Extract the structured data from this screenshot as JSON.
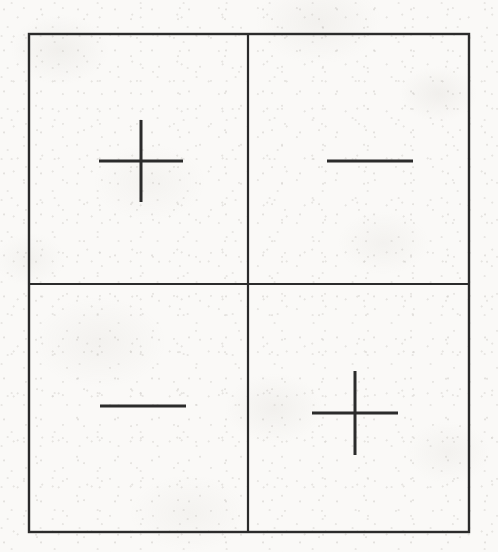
{
  "figure": {
    "canvas": {
      "width": 498,
      "height": 552
    },
    "background_color": "#faf9f7",
    "ink_color": "#2b2b2b",
    "frame": {
      "label": "outer-rectangle",
      "x": 29,
      "y": 34,
      "width": 440,
      "height": 498,
      "stroke_width": 2.4
    },
    "dividers": [
      {
        "label": "vertical-divider",
        "orientation": "vertical",
        "position": 248,
        "from": 34,
        "to": 532,
        "stroke_width": 2.2
      },
      {
        "label": "horizontal-divider",
        "orientation": "horizontal",
        "position": 284,
        "from": 29,
        "to": 469,
        "stroke_width": 2.2
      }
    ],
    "quadrants": [
      {
        "id": "top-left",
        "name": "quadrant-top-left",
        "symbol": "plus",
        "symbol_label": "+",
        "center_x": 141,
        "center_y": 161,
        "arm_half_length_h": 42,
        "arm_half_length_v": 41,
        "stroke_width": 3.0
      },
      {
        "id": "top-right",
        "name": "quadrant-top-right",
        "symbol": "minus",
        "symbol_label": "−",
        "center_x": 370,
        "center_y": 161,
        "arm_half_length_h": 43,
        "arm_half_length_v": 0,
        "stroke_width": 3.2
      },
      {
        "id": "bottom-left",
        "name": "quadrant-bottom-left",
        "symbol": "minus",
        "symbol_label": "−",
        "center_x": 143,
        "center_y": 406,
        "arm_half_length_h": 43,
        "arm_half_length_v": 0,
        "stroke_width": 3.2
      },
      {
        "id": "bottom-right",
        "name": "quadrant-bottom-right",
        "symbol": "plus",
        "symbol_label": "+",
        "center_x": 355,
        "center_y": 413,
        "arm_half_length_h": 43,
        "arm_half_length_v": 42,
        "stroke_width": 3.0
      }
    ]
  }
}
